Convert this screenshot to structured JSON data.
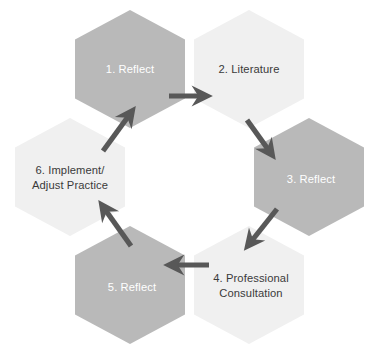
{
  "diagram": {
    "type": "hexagon-cycle",
    "background_color": "#ffffff",
    "colors": {
      "hex_gray": "#b9b9b9",
      "hex_light": "#f0f0f0",
      "arrow": "#585858",
      "text_dark": "#3a3a3a",
      "text_light": "#ffffff"
    },
    "steps": [
      {
        "id": "step-1",
        "number": "1.",
        "label": "1. Reflect",
        "lines": [
          "1. Reflect"
        ],
        "fill": "#b9b9b9",
        "text_color": "#ffffff",
        "center": {
          "x": 130,
          "y": 69
        }
      },
      {
        "id": "step-2",
        "number": "2.",
        "label": "2. Literature",
        "lines": [
          "2. Literature"
        ],
        "fill": "#f0f0f0",
        "text_color": "#3a3a3a",
        "center": {
          "x": 249,
          "y": 69
        }
      },
      {
        "id": "step-3",
        "number": "3.",
        "label": "3. Reflect",
        "lines": [
          "3. Reflect"
        ],
        "fill": "#b9b9b9",
        "text_color": "#ffffff",
        "center": {
          "x": 309,
          "y": 177
        }
      },
      {
        "id": "step-4",
        "number": "4.",
        "label": "4. Professional Consultation",
        "lines": [
          "4. Professional",
          "Consultation"
        ],
        "fill": "#f0f0f0",
        "text_color": "#3a3a3a",
        "center": {
          "x": 249,
          "y": 285
        }
      },
      {
        "id": "step-5",
        "number": "5.",
        "label": "5. Reflect",
        "lines": [
          "5. Reflect"
        ],
        "fill": "#b9b9b9",
        "text_color": "#ffffff",
        "center": {
          "x": 130,
          "y": 285
        }
      },
      {
        "id": "step-6",
        "number": "6.",
        "label": "6. Implement/ Adjust Practice",
        "lines": [
          "6. Implement/",
          "Adjust Practice"
        ],
        "fill": "#f0f0f0",
        "text_color": "#3a3a3a",
        "center": {
          "x": 70,
          "y": 177
        }
      }
    ],
    "arrows": [
      {
        "id": "arrow-1-2",
        "from": "step-1",
        "to": "step-2",
        "direction": "right"
      },
      {
        "id": "arrow-2-3",
        "from": "step-2",
        "to": "step-3",
        "direction": "down-right"
      },
      {
        "id": "arrow-3-4",
        "from": "step-3",
        "to": "step-4",
        "direction": "down-left"
      },
      {
        "id": "arrow-4-5",
        "from": "step-4",
        "to": "step-5",
        "direction": "left"
      },
      {
        "id": "arrow-5-6",
        "from": "step-5",
        "to": "step-6",
        "direction": "up-left"
      },
      {
        "id": "arrow-6-1",
        "from": "step-6",
        "to": "step-1",
        "direction": "up-right"
      }
    ]
  }
}
